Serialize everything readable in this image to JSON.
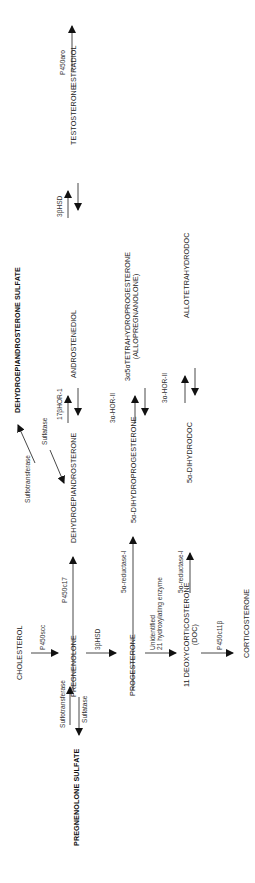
{
  "diagram": {
    "type": "steroid biosynthesis pathway",
    "orientation": "rotated 90 degrees counter-clockwise",
    "nodes": {
      "cholesterol": "CHOLESTEROL",
      "pregnenolone": "PREGNENOLONE",
      "pregnenolone_sulfate": "PREGNENOLONE SULFATE",
      "progesterone": "PROGESTERONE",
      "doc_line1": "11  DEOXYCORTICOSTERONE",
      "doc_line2": "(DOC)",
      "corticosterone": "CORTICOSTERONE",
      "dhea": "DEHYDROEPIANDROSTERONE",
      "dhea_sulfate": "DEHYDROEPIANDROSTERONE SULFATE",
      "dihydroprogesterone": "5α-DIHYDROPROGESTERONE",
      "dihydrodoc": "5α-DIHYDRODOC",
      "androstenediol": "ANDROSTENEDIOL",
      "allopregnanolone_line1": "3α5αTETRAHYDROPROGESTERONE",
      "allopregnanolone_line2": "(ALLOPREGNANOLONE)",
      "allotetrahydrodoc": "ALLOTETRAHYDRODOC",
      "testosterone": "TESTOSTERONE",
      "estradiol": "ESTRADIOL"
    },
    "enzymes": {
      "p450scc": "P450scc",
      "hsd3b_1": "3βHSD",
      "sulfotransferase_preg": "Sulfotransferase",
      "sulfatase_preg": "Sulfatase",
      "unidentified_line1": "Unidentified",
      "unidentified_line2": "21 hydroxylating enzyme",
      "p450c11b": "P450c11β",
      "p450c17": "P450c17",
      "reductase_prog": "5α-reductase-I",
      "reductase_doc": "5α-reductase-I",
      "sulfotransferase_dhea": "Sulfotransferase",
      "sulfatase_dhea": "Sulfatase",
      "hor_17b": "17βHOR-1",
      "hor_3a_prog": "3α-HOR-II",
      "hor_3a_doc": "3α-HOR-II",
      "hsd3b_2": "3βHSD",
      "p450aro": "P450aro"
    },
    "edges": [
      {
        "from": "CHOLESTEROL",
        "to": "PREGNENOLONE",
        "enzyme": "P450scc"
      },
      {
        "from": "PREGNENOLONE",
        "to": "PROGESTERONE",
        "enzyme": "3βHSD"
      },
      {
        "from": "PREGNENOLONE",
        "to": "PREGNENOLONE SULFATE",
        "enzyme": "Sulfotransferase"
      },
      {
        "from": "PREGNENOLONE SULFATE",
        "to": "PREGNENOLONE",
        "enzyme": "Sulfatase"
      },
      {
        "from": "PROGESTERONE",
        "to": "11 DEOXYCORTICOSTERONE (DOC)",
        "enzyme": "Unidentified 21 hydroxylating enzyme"
      },
      {
        "from": "11 DEOXYCORTICOSTERONE (DOC)",
        "to": "CORTICOSTERONE",
        "enzyme": "P450c11β"
      },
      {
        "from": "PREGNENOLONE",
        "to": "DEHYDROEPIANDROSTERONE",
        "enzyme": "P450c17"
      },
      {
        "from": "PROGESTERONE",
        "to": "5α-DIHYDROPROGESTERONE",
        "enzyme": "5α-reductase-I"
      },
      {
        "from": "11 DEOXYCORTICOSTERONE (DOC)",
        "to": "5α-DIHYDRODOC",
        "enzyme": "5α-reductase-I"
      },
      {
        "from": "DEHYDROEPIANDROSTERONE",
        "to": "DEHYDROEPIANDROSTERONE SULFATE",
        "enzyme": "Sulfotransferase"
      },
      {
        "from": "DEHYDROEPIANDROSTERONE SULFATE",
        "to": "DEHYDROEPIANDROSTERONE",
        "enzyme": "Sulfatase"
      },
      {
        "from": "DEHYDROEPIANDROSTERONE",
        "to": "ANDROSTENEDIOL",
        "enzyme": "17βHOR-1",
        "reversible": true
      },
      {
        "from": "5α-DIHYDROPROGESTERONE",
        "to": "3α5αTETRAHYDROPROGESTERONE",
        "enzyme": "3α-HOR-II",
        "reversible": true
      },
      {
        "from": "5α-DIHYDRODOC",
        "to": "ALLOTETRAHYDRODOC",
        "enzyme": "3α-HOR-II",
        "reversible": true
      },
      {
        "from": "ANDROSTENEDIOL",
        "to": "TESTOSTERONE",
        "enzyme": "3βHSD",
        "reversible": true
      },
      {
        "from": "TESTOSTERONE",
        "to": "ESTRADIOL",
        "enzyme": "P450aro"
      }
    ]
  }
}
